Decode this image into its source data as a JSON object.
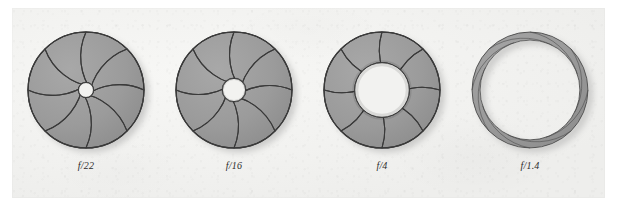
{
  "figure": {
    "kind": "camera-aperture-diagram",
    "title": "",
    "caption_bleed_text": "",
    "background_color": "#ffffff",
    "panel_color": "#f2f2f0",
    "blade_fill_color": "#9b9b9b",
    "blade_stroke_color": "#3a3a3a",
    "opening_color": "#f2f2f0",
    "shadow_color": "#c9c9c7",
    "blade_count": 8
  },
  "apertures": [
    {
      "label": "f/22",
      "label_f": "f",
      "label_rest": "/22",
      "opening_ratio": 0.13,
      "outer_radius": 58,
      "center_x": 100,
      "center_y": 95,
      "open": false
    },
    {
      "label": "f/16",
      "label_f": "f",
      "label_rest": "/16",
      "opening_ratio": 0.2,
      "outer_radius": 58,
      "center_x": 245,
      "center_y": 95,
      "open": false
    },
    {
      "label": "f/4",
      "label_f": "f",
      "label_rest": "/4",
      "opening_ratio": 0.47,
      "outer_radius": 58,
      "center_x": 390,
      "center_y": 95,
      "open": false
    },
    {
      "label": "f/1.4",
      "label_f": "f",
      "label_rest": "/1.4",
      "opening_ratio": 0.86,
      "outer_radius": 58,
      "center_x": 535,
      "center_y": 95,
      "open": true
    }
  ]
}
